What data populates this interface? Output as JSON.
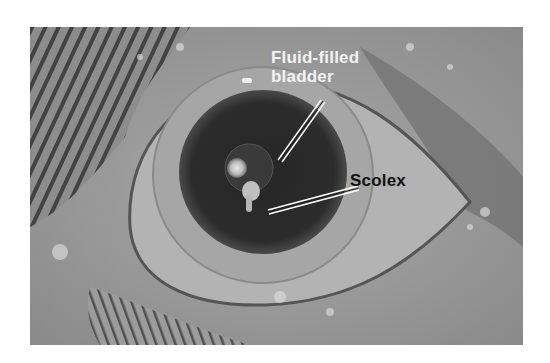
{
  "figure": {
    "labels": {
      "bladder_line1": "Fluid-filled",
      "bladder_line2": "bladder",
      "scolex": "Scolex"
    },
    "colors": {
      "background": "#ffffff",
      "pupil": "#2a2a2a",
      "iris": "#a8a8a8",
      "skin": "#9a9a9a",
      "bladder_label": "#f2f2f2",
      "scolex_label": "#111111"
    }
  }
}
